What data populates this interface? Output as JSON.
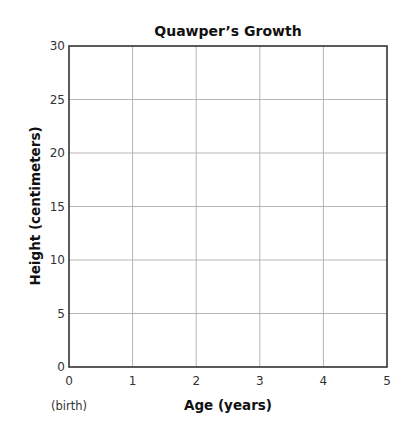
{
  "chart_data": {
    "type": "line",
    "title": "Quawper’s Growth",
    "xlabel": "Age (years)",
    "ylabel": "Height (centimeters)",
    "x_ticks": [
      "0",
      "1",
      "2",
      "3",
      "4",
      "5"
    ],
    "x_tick_note": "(birth)",
    "y_ticks": [
      "0",
      "5",
      "10",
      "15",
      "20",
      "25",
      "30"
    ],
    "xlim": [
      0,
      5
    ],
    "ylim": [
      0,
      30
    ],
    "grid": true,
    "legend": null,
    "series": []
  },
  "colors": {
    "frame": "#333333",
    "grid": "#b5b5b5",
    "text": "#222222"
  }
}
